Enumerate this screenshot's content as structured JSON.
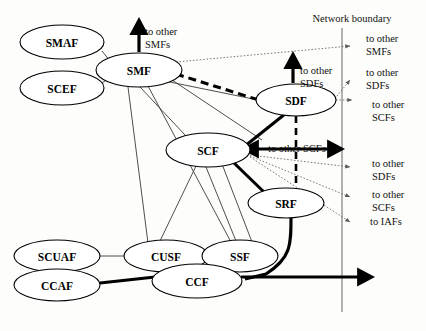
{
  "diagram": {
    "title": "Network boundary",
    "nodes": [
      {
        "id": "smaf",
        "label": "SMAF",
        "cx": 62,
        "cy": 42,
        "rx": 42,
        "ry": 17
      },
      {
        "id": "scef",
        "label": "SCEF",
        "cx": 62,
        "cy": 88,
        "rx": 42,
        "ry": 17
      },
      {
        "id": "smf",
        "label": "SMF",
        "cx": 139,
        "cy": 70,
        "rx": 43,
        "ry": 17
      },
      {
        "id": "sdf",
        "label": "SDF",
        "cx": 296,
        "cy": 100,
        "rx": 40,
        "ry": 16
      },
      {
        "id": "scf",
        "label": "SCF",
        "cx": 208,
        "cy": 150,
        "rx": 42,
        "ry": 17
      },
      {
        "id": "srf",
        "label": "SRF",
        "cx": 286,
        "cy": 203,
        "rx": 38,
        "ry": 15
      },
      {
        "id": "scuaf",
        "label": "SCUAF",
        "cx": 57,
        "cy": 256,
        "rx": 43,
        "ry": 16
      },
      {
        "id": "cusf",
        "label": "CUSF",
        "cx": 166,
        "cy": 256,
        "rx": 42,
        "ry": 16
      },
      {
        "id": "ssf",
        "label": "SSF",
        "cx": 240,
        "cy": 256,
        "rx": 38,
        "ry": 16
      },
      {
        "id": "ccf",
        "label": "CCF",
        "cx": 197,
        "cy": 281,
        "rx": 45,
        "ry": 17
      },
      {
        "id": "ccaf",
        "label": "CCAF",
        "cx": 57,
        "cy": 285,
        "rx": 43,
        "ry": 16
      }
    ],
    "edge_labels": [
      {
        "id": "smf-up",
        "line1": "to other",
        "line2": "SMFs",
        "x": 145,
        "y": 31
      },
      {
        "id": "sdf-up",
        "line1": "to other",
        "line2": "SDFs",
        "x": 300,
        "y": 70
      },
      {
        "id": "scf-right",
        "line1": "to other SCFs",
        "line2": "",
        "x": 268,
        "y": 148
      }
    ],
    "boundary_labels": [
      {
        "id": "b1",
        "line1": "to other",
        "line2": "SMFs",
        "x": 366,
        "y": 38
      },
      {
        "id": "b2",
        "line1": "to other",
        "line2": "SDFs",
        "x": 366,
        "y": 72
      },
      {
        "id": "b3",
        "line1": "to other",
        "line2": "SCFs",
        "x": 372,
        "y": 104
      },
      {
        "id": "b4",
        "line1": "to other",
        "line2": "SDFs",
        "x": 372,
        "y": 163
      },
      {
        "id": "b5",
        "line1": "to other",
        "line2": "SCFs",
        "x": 372,
        "y": 194
      },
      {
        "id": "b6",
        "line1": "to IAFs",
        "line2": "",
        "x": 370,
        "y": 221
      }
    ],
    "boundary": {
      "label": "Network boundary",
      "label_x": 352,
      "label_y": 22,
      "line_x": 342,
      "line_y1": 28,
      "line_y2": 312
    }
  }
}
